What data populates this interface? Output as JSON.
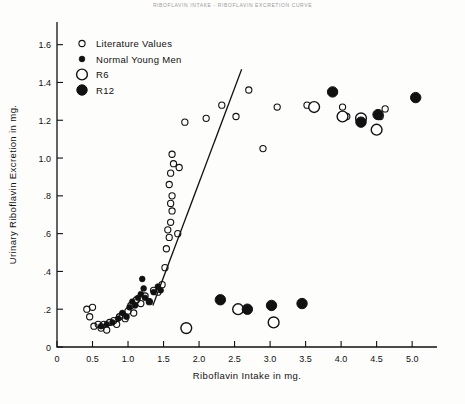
{
  "page": {
    "top_caption": "RIBOFLAVIN  INTAKE  -  RIBOFLAVIN  EXCRETION  CURVE"
  },
  "chart_data": {
    "type": "scatter",
    "title": "",
    "xlabel": "Riboflavin  Intake  in  mg.",
    "ylabel": "Urinary   Riboflavin   Excretion   in  mg.",
    "xlim": [
      0,
      5.35
    ],
    "ylim": [
      0,
      1.72
    ],
    "xticks": [
      0,
      0.5,
      1.0,
      1.5,
      2.0,
      2.5,
      3.0,
      3.5,
      4.0,
      4.5,
      5.0
    ],
    "xtick_labels": [
      "0",
      "0.5",
      "1.0",
      "1.5",
      "2.0",
      "2.5",
      "3.0",
      "3.5",
      "4.0",
      "4.5",
      "5.0"
    ],
    "yticks": [
      0,
      0.2,
      0.4,
      0.6,
      0.8,
      1.0,
      1.2,
      1.4,
      1.6
    ],
    "ytick_labels": [
      "0",
      ".2",
      ".4",
      ".6",
      ".8",
      "1.0",
      "1.2",
      "1.4",
      "1.6"
    ],
    "grid": false,
    "legend_position": "top-left",
    "legend": [
      {
        "label": "Literature  Values",
        "marker": "open-small"
      },
      {
        "label": "Normal  Young  Men",
        "marker": "filled-small"
      },
      {
        "label": "R6",
        "marker": "open-big"
      },
      {
        "label": "R12",
        "marker": "filled-big"
      }
    ],
    "series": [
      {
        "name": "Literature  Values",
        "marker": "open-small",
        "points": [
          [
            0.42,
            0.2
          ],
          [
            0.46,
            0.16
          ],
          [
            0.5,
            0.21
          ],
          [
            0.52,
            0.11
          ],
          [
            0.58,
            0.12
          ],
          [
            0.62,
            0.1
          ],
          [
            0.66,
            0.12
          ],
          [
            0.7,
            0.09
          ],
          [
            0.74,
            0.13
          ],
          [
            0.8,
            0.14
          ],
          [
            0.84,
            0.12
          ],
          [
            0.88,
            0.16
          ],
          [
            0.92,
            0.17
          ],
          [
            0.96,
            0.15
          ],
          [
            1.0,
            0.19
          ],
          [
            1.04,
            0.22
          ],
          [
            1.08,
            0.18
          ],
          [
            1.12,
            0.25
          ],
          [
            1.18,
            0.23
          ],
          [
            1.24,
            0.27
          ],
          [
            1.3,
            0.24
          ],
          [
            1.36,
            0.3
          ],
          [
            1.42,
            0.29
          ],
          [
            1.48,
            0.33
          ],
          [
            1.52,
            0.42
          ],
          [
            1.54,
            0.52
          ],
          [
            1.56,
            0.62
          ],
          [
            1.58,
            0.58
          ],
          [
            1.6,
            0.66
          ],
          [
            1.62,
            0.72
          ],
          [
            1.6,
            0.76
          ],
          [
            1.62,
            0.8
          ],
          [
            1.58,
            0.86
          ],
          [
            1.6,
            0.92
          ],
          [
            1.64,
            0.97
          ],
          [
            1.62,
            1.02
          ],
          [
            1.7,
            0.6
          ],
          [
            1.72,
            0.95
          ],
          [
            1.8,
            1.19
          ],
          [
            2.1,
            1.21
          ],
          [
            2.32,
            1.28
          ],
          [
            2.52,
            1.22
          ],
          [
            2.7,
            1.36
          ],
          [
            2.9,
            1.05
          ],
          [
            3.1,
            1.27
          ],
          [
            3.52,
            1.28
          ],
          [
            4.02,
            1.27
          ],
          [
            4.08,
            1.22
          ],
          [
            4.3,
            1.19
          ],
          [
            4.55,
            1.22
          ],
          [
            4.62,
            1.26
          ]
        ]
      },
      {
        "name": "Normal  Young  Men",
        "marker": "filled-small",
        "points": [
          [
            0.62,
            0.11
          ],
          [
            0.7,
            0.12
          ],
          [
            0.78,
            0.13
          ],
          [
            0.86,
            0.15
          ],
          [
            0.92,
            0.18
          ],
          [
            0.98,
            0.16
          ],
          [
            1.02,
            0.21
          ],
          [
            1.06,
            0.24
          ],
          [
            1.1,
            0.22
          ],
          [
            1.14,
            0.26
          ],
          [
            1.18,
            0.28
          ],
          [
            1.22,
            0.31
          ],
          [
            1.24,
            0.26
          ],
          [
            1.3,
            0.24
          ],
          [
            1.36,
            0.29
          ],
          [
            1.42,
            0.32
          ],
          [
            1.46,
            0.3
          ],
          [
            1.2,
            0.36
          ]
        ]
      },
      {
        "name": "R6",
        "marker": "open-big",
        "points": [
          [
            1.82,
            0.1
          ],
          [
            2.55,
            0.2
          ],
          [
            3.05,
            0.13
          ],
          [
            3.62,
            1.27
          ],
          [
            4.02,
            1.22
          ],
          [
            4.28,
            1.21
          ],
          [
            4.5,
            1.15
          ]
        ]
      },
      {
        "name": "R12",
        "marker": "filled-big",
        "points": [
          [
            2.3,
            0.25
          ],
          [
            2.68,
            0.2
          ],
          [
            3.02,
            0.22
          ],
          [
            3.45,
            0.23
          ],
          [
            3.88,
            1.35
          ],
          [
            4.28,
            1.19
          ],
          [
            4.52,
            1.23
          ],
          [
            5.05,
            1.32
          ]
        ]
      }
    ],
    "trend_line": {
      "name": "regression-line",
      "from": [
        1.35,
        0.22
      ],
      "to": [
        2.6,
        1.47
      ]
    }
  }
}
